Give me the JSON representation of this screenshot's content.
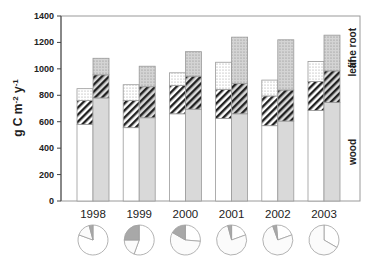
{
  "chart_data": {
    "type": "bar",
    "subtype": "paired stacked bars with pie insets",
    "title": "",
    "xlabel": "",
    "ylabel": "g C m-2 y-1",
    "ylabel_parts": {
      "base": "g C m",
      "exp1": "-2",
      "mid": " y",
      "exp2": "-1"
    },
    "ylim": [
      0,
      1400
    ],
    "yticks": [
      0,
      200,
      400,
      600,
      800,
      1000,
      1200,
      1400
    ],
    "categories": [
      "1998",
      "1999",
      "2000",
      "2001",
      "2002",
      "2003"
    ],
    "stack_components": [
      "wood",
      "leaf",
      "fine root"
    ],
    "legend": {
      "position": "right, rotated vertical",
      "labels": [
        "wood",
        "leaf",
        "fine root"
      ]
    },
    "series": [
      {
        "name": "left bar (white)",
        "cumulative_tops": {
          "wood": [
            580,
            555,
            660,
            625,
            570,
            685
          ],
          "leaf": [
            760,
            760,
            875,
            845,
            795,
            905
          ],
          "fine root": [
            850,
            880,
            970,
            1050,
            915,
            1055
          ]
        }
      },
      {
        "name": "right bar (gray)",
        "cumulative_tops": {
          "wood": [
            780,
            630,
            695,
            660,
            605,
            745
          ],
          "leaf": [
            955,
            865,
            945,
            890,
            840,
            985
          ],
          "fine root": [
            1080,
            1020,
            1130,
            1240,
            1220,
            1255
          ]
        }
      }
    ],
    "pies": [
      {
        "year": "1998",
        "slices_deg": [
          {
            "from": 0,
            "to": 290,
            "fill": "white"
          },
          {
            "from": 290,
            "to": 345,
            "fill": "light"
          },
          {
            "from": 345,
            "to": 360,
            "fill": "gray"
          }
        ]
      },
      {
        "year": "1999",
        "slices_deg": [
          {
            "from": 0,
            "to": 200,
            "fill": "white"
          },
          {
            "from": 200,
            "to": 270,
            "fill": "light"
          },
          {
            "from": 270,
            "to": 360,
            "fill": "gray"
          }
        ]
      },
      {
        "year": "2000",
        "slices_deg": [
          {
            "from": 0,
            "to": 95,
            "fill": "white"
          },
          {
            "from": 95,
            "to": 300,
            "fill": "light"
          },
          {
            "from": 300,
            "to": 360,
            "fill": "gray"
          }
        ]
      },
      {
        "year": "2001",
        "slices_deg": [
          {
            "from": 0,
            "to": 70,
            "fill": "white"
          },
          {
            "from": 70,
            "to": 345,
            "fill": "light"
          },
          {
            "from": 345,
            "to": 360,
            "fill": "gray"
          }
        ]
      },
      {
        "year": "2002",
        "slices_deg": [
          {
            "from": 355,
            "to": 70,
            "fill": "white"
          },
          {
            "from": 70,
            "to": 340,
            "fill": "light"
          },
          {
            "from": 340,
            "to": 355,
            "fill": "gray"
          }
        ]
      },
      {
        "year": "2003",
        "slices_deg": [
          {
            "from": 0,
            "to": 120,
            "fill": "white"
          },
          {
            "from": 120,
            "to": 360,
            "fill": "light"
          }
        ]
      }
    ],
    "grid": false,
    "colors": {
      "white_bar": "#ffffff",
      "gray_bar": "#d9d9d9",
      "hatch": "#222222",
      "pie_gray": "#a8a8a8",
      "outline": "#9a9a9a"
    }
  }
}
